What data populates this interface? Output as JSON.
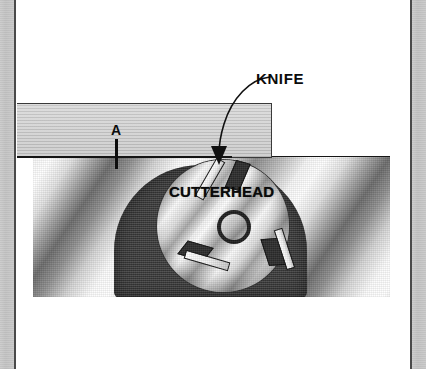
{
  "figure": {
    "labels": {
      "knife": "KNIFE",
      "cutterhead": "CUTTERHEAD",
      "point_a": "A"
    },
    "colors": {
      "ink": "#0b0b0b",
      "board_fill": "#c6c6c6",
      "housing_fill": "#3b3b3b",
      "blade_fill": "#ffffff",
      "gib_fill": "#2c2c2c",
      "page_edge": "#cbcbcb"
    },
    "parts": {
      "board": "workpiece-board",
      "housing": "cutterhead-housing",
      "disc": "cutterhead-disc",
      "hub": "arbor-hub-hole",
      "surface": "outfeed-table-surface-line"
    },
    "knives": [
      {
        "id": "knife-top",
        "position": "top-cutting-point"
      },
      {
        "id": "knife-lower-left",
        "position": "lower-left"
      },
      {
        "id": "knife-right",
        "position": "right"
      }
    ]
  }
}
